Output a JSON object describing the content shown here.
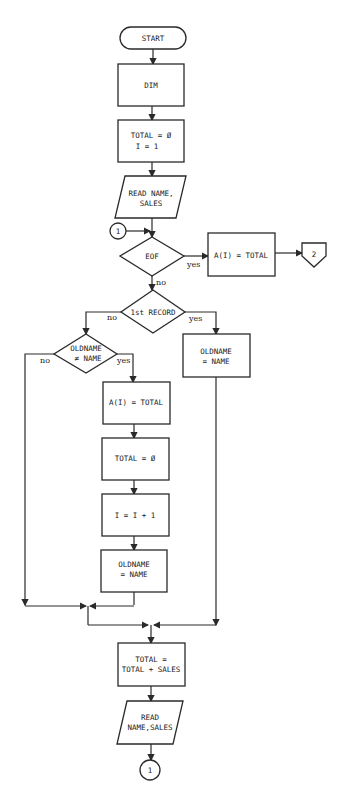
{
  "flowchart": {
    "start": "START",
    "dim": "DIM",
    "init": [
      "TOTAL = Ø",
      "I = 1"
    ],
    "read1": [
      "READ NAME,",
      "SALES"
    ],
    "connector_in": "1",
    "eof": "EOF",
    "eof_yes": "yes",
    "eof_no": "no",
    "final_assign": "A(I) = TOTAL",
    "offpage": "2",
    "first_record": "1st RECORD",
    "first_no": "no",
    "first_yes": "yes",
    "oldname_check": [
      "OLDNAME",
      "≠ NAME"
    ],
    "check_no": "no",
    "check_yes": "yes",
    "set_oldname_right": [
      "OLDNAME",
      "= NAME"
    ],
    "assign_a": "A(I) = TOTAL",
    "reset_total": "TOTAL = Ø",
    "increment": "I = I + 1",
    "set_oldname_left": [
      "OLDNAME",
      "= NAME"
    ],
    "accumulate": [
      "TOTAL =",
      "TOTAL + SALES"
    ],
    "read2": [
      "READ",
      "NAME,SALES"
    ],
    "connector_out": "1"
  }
}
